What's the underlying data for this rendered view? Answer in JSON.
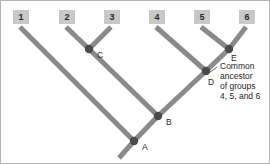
{
  "figure": {
    "canvas": {
      "width": 270,
      "height": 164
    },
    "colors": {
      "background": "#ffffff",
      "border": "#b4b4b4",
      "branch": "#8a8a8a",
      "node_dot": "#4a4a4a",
      "taxon_box_fill": "#c8c8c8",
      "taxon_number": "#2b2b2b",
      "text": "#1f1f1f",
      "leader": "#4a4a4a"
    }
  },
  "taxa": [
    {
      "label": "1",
      "box_x": 12,
      "box_y": 9,
      "tip_x": 19,
      "tip_y": 26
    },
    {
      "label": "2",
      "box_x": 58,
      "box_y": 9,
      "tip_x": 65,
      "tip_y": 26
    },
    {
      "label": "3",
      "box_x": 103,
      "box_y": 9,
      "tip_x": 110,
      "tip_y": 26
    },
    {
      "label": "4",
      "box_x": 148,
      "box_y": 9,
      "tip_x": 155,
      "tip_y": 26
    },
    {
      "label": "5",
      "box_x": 193,
      "box_y": 9,
      "tip_x": 200,
      "tip_y": 26
    },
    {
      "label": "6",
      "box_x": 238,
      "box_y": 9,
      "tip_x": 245,
      "tip_y": 26
    }
  ],
  "taxon_box": {
    "width": 16,
    "height": 14
  },
  "nodes": [
    {
      "label": "A",
      "x": 133,
      "y": 140,
      "label_x": 141,
      "label_y": 147
    },
    {
      "label": "B",
      "x": 157,
      "y": 115,
      "label_x": 165,
      "label_y": 122
    },
    {
      "label": "C",
      "x": 88,
      "y": 48,
      "label_x": 96,
      "label_y": 55
    },
    {
      "label": "D",
      "x": 205,
      "y": 70,
      "label_x": 207,
      "label_y": 82
    },
    {
      "label": "E",
      "x": 228,
      "y": 48,
      "label_x": 230,
      "label_y": 58
    }
  ],
  "node_dot_radius": 4.2,
  "branches": [
    {
      "name": "tip-1-to-A",
      "x1": 19,
      "y1": 26,
      "x2": 133,
      "y2": 140
    },
    {
      "name": "tip-2-to-C",
      "x1": 65,
      "y1": 26,
      "x2": 88,
      "y2": 48
    },
    {
      "name": "tip-3-to-C",
      "x1": 110,
      "y1": 26,
      "x2": 88,
      "y2": 48
    },
    {
      "name": "C-to-B",
      "x1": 88,
      "y1": 48,
      "x2": 157,
      "y2": 115
    },
    {
      "name": "tip-4-to-D",
      "x1": 155,
      "y1": 26,
      "x2": 205,
      "y2": 70
    },
    {
      "name": "tip-5-to-E",
      "x1": 200,
      "y1": 26,
      "x2": 228,
      "y2": 48
    },
    {
      "name": "tip-6-to-E",
      "x1": 245,
      "y1": 26,
      "x2": 228,
      "y2": 48
    },
    {
      "name": "E-to-D",
      "x1": 228,
      "y1": 48,
      "x2": 205,
      "y2": 70
    },
    {
      "name": "D-to-B",
      "x1": 205,
      "y1": 70,
      "x2": 157,
      "y2": 115
    },
    {
      "name": "B-to-A",
      "x1": 157,
      "y1": 115,
      "x2": 133,
      "y2": 140
    },
    {
      "name": "A-to-root",
      "x1": 133,
      "y1": 140,
      "x2": 118,
      "y2": 157
    }
  ],
  "branch_width": 5,
  "annotation": {
    "leader": {
      "x1": 208,
      "y1": 72,
      "x2": 216,
      "y2": 66
    },
    "text_x": 219,
    "text_y": 68,
    "line_height": 10,
    "lines": [
      "Common",
      "ancestor",
      "of groups",
      "4, 5, and 6"
    ]
  }
}
